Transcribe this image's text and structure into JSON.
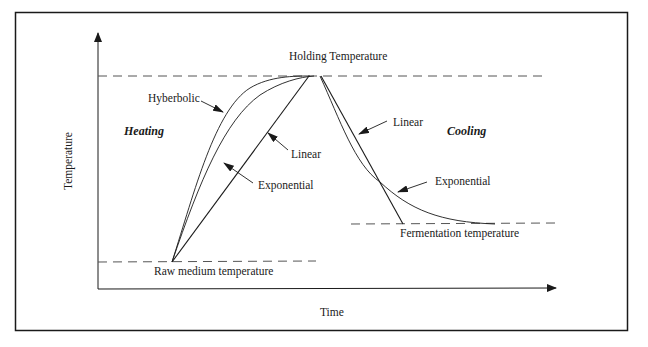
{
  "diagram": {
    "type": "process-temperature-profile",
    "axes": {
      "x_label": "Time",
      "y_label": "Temperature"
    },
    "levels": {
      "holding": "Holding Temperature",
      "raw_medium": "Raw medium temperature",
      "fermentation": "Fermentation temperature"
    },
    "regions": {
      "heating": "Heating",
      "cooling": "Cooling"
    },
    "heating_curves": {
      "hyperbolic": "Hyberbolic",
      "exponential": "Exponential",
      "linear": "Linear"
    },
    "cooling_curves": {
      "linear": "Linear",
      "exponential": "Exponential"
    },
    "colors": {
      "line": "#1a1a1a",
      "dashed": "#555555",
      "background": "#ffffff"
    }
  }
}
